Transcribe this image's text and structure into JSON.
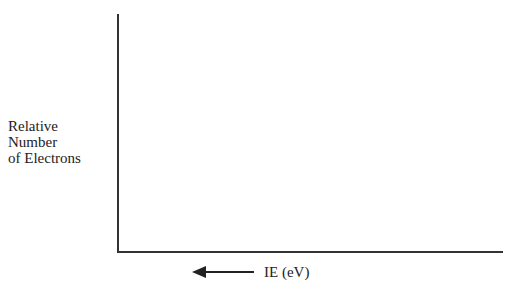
{
  "chart_data": {
    "type": "line",
    "title": "",
    "xlabel": "IE (eV)",
    "xlabel_arrow": "left",
    "ylabel": "Relative Number of Electrons",
    "ylabel_lines": [
      "Relative",
      "Number",
      "of Electrons"
    ],
    "series": [],
    "x": [],
    "grid": false,
    "legend": null,
    "ticks": {
      "x": [],
      "y": []
    },
    "note": "Blank axes template (no data plotted)"
  },
  "labels": {
    "y_line1": "Relative",
    "y_line2": "Number",
    "y_line3": "of Electrons",
    "x": "IE (eV)"
  }
}
